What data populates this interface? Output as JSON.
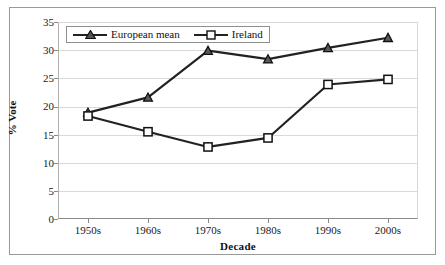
{
  "chart_data": {
    "type": "line",
    "title": "",
    "xlabel": "Decade",
    "ylabel": "% Vote",
    "categories": [
      "1950s",
      "1960s",
      "1970s",
      "1980s",
      "1990s",
      "2000s"
    ],
    "ylim": [
      0,
      35
    ],
    "ytick_values": [
      0,
      5,
      10,
      15,
      20,
      25,
      30,
      35
    ],
    "ytick_labels": [
      "0",
      "5",
      "10",
      "15",
      "20",
      "25",
      "30",
      "35"
    ],
    "grid": true,
    "grid_axis": "y",
    "legend_position": "top-left-inside",
    "series": [
      {
        "name": "European mean",
        "marker": "triangle",
        "color": "#222222",
        "values": [
          18.9,
          21.6,
          29.9,
          28.4,
          30.4,
          32.2
        ]
      },
      {
        "name": "Ireland",
        "marker": "square-open",
        "color": "#222222",
        "values": [
          18.3,
          15.5,
          12.8,
          14.4,
          23.9,
          24.8
        ]
      }
    ]
  },
  "axes": {
    "y_title": "% Vote",
    "x_title": "Decade",
    "y_ticks": [
      "35",
      "30",
      "25",
      "20",
      "15",
      "10",
      "5",
      "0"
    ],
    "x_ticks": [
      "1950s",
      "1960s",
      "1970s",
      "1980s",
      "1990s",
      "2000s"
    ]
  },
  "legend": {
    "items": [
      {
        "label": "European mean",
        "marker": "triangle-marker"
      },
      {
        "label": "Ireland",
        "marker": "square-marker"
      }
    ]
  },
  "colors": {
    "series_line": "#222222",
    "gridline": "#d9d9d9",
    "axis": "#8a8a8a",
    "frame": "#9a9a9a",
    "background": "#ffffff",
    "text": "#111111"
  }
}
